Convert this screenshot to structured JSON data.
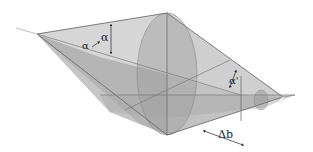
{
  "diagram": {
    "labels": {
      "alpha": "α",
      "alpha_small": "α",
      "alpha_prime": "α'",
      "delta_b": "Δb"
    },
    "colors": {
      "background": "#ffffff",
      "light_face": "#d4d4d4",
      "mid_face": "#b8b8b8",
      "dark_face": "#a6a6a6",
      "ellipse": "#9c9c9c",
      "edge": "#6e6e6e",
      "arrow": "#222222"
    }
  }
}
